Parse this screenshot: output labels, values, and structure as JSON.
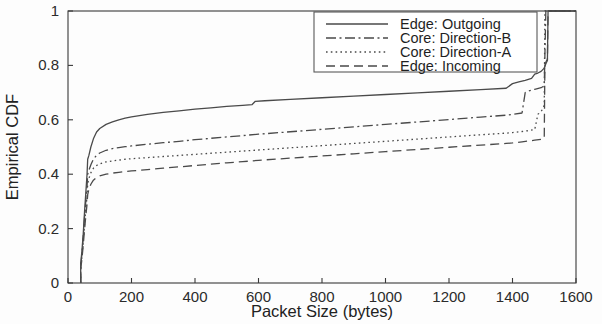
{
  "chart_data": {
    "type": "line",
    "title": "",
    "xlabel": "Packet Size (bytes)",
    "ylabel": "Empirical CDF",
    "xlim": [
      0,
      1600
    ],
    "ylim": [
      0,
      1
    ],
    "xticks": [
      0,
      200,
      400,
      600,
      800,
      1000,
      1200,
      1400,
      1600
    ],
    "xtick_labels": [
      "0",
      "200",
      "400",
      "600",
      "800",
      "1000",
      "1200",
      "1400",
      "1600"
    ],
    "yticks": [
      0,
      0.2,
      0.4,
      0.6,
      0.8,
      1
    ],
    "ytick_labels": [
      "0",
      "0.2",
      "0.4",
      "0.6",
      "0.8",
      "1"
    ],
    "grid": false,
    "legend_position": "upper center",
    "line_color": "#4a4a4a",
    "series": [
      {
        "name": "Edge: Outgoing",
        "dash": "solid",
        "points": [
          [
            40,
            0.0
          ],
          [
            40,
            0.07
          ],
          [
            44,
            0.12
          ],
          [
            48,
            0.18
          ],
          [
            52,
            0.26
          ],
          [
            56,
            0.33
          ],
          [
            60,
            0.4
          ],
          [
            62,
            0.455
          ],
          [
            66,
            0.47
          ],
          [
            72,
            0.5
          ],
          [
            80,
            0.53
          ],
          [
            90,
            0.555
          ],
          [
            100,
            0.568
          ],
          [
            120,
            0.583
          ],
          [
            140,
            0.592
          ],
          [
            160,
            0.6
          ],
          [
            180,
            0.606
          ],
          [
            200,
            0.611
          ],
          [
            250,
            0.62
          ],
          [
            300,
            0.627
          ],
          [
            350,
            0.633
          ],
          [
            400,
            0.639
          ],
          [
            450,
            0.644
          ],
          [
            500,
            0.649
          ],
          [
            550,
            0.653
          ],
          [
            580,
            0.656
          ],
          [
            590,
            0.668
          ],
          [
            620,
            0.67
          ],
          [
            700,
            0.675
          ],
          [
            800,
            0.681
          ],
          [
            900,
            0.687
          ],
          [
            1000,
            0.693
          ],
          [
            1100,
            0.699
          ],
          [
            1200,
            0.705
          ],
          [
            1300,
            0.711
          ],
          [
            1380,
            0.716
          ],
          [
            1400,
            0.733
          ],
          [
            1420,
            0.739
          ],
          [
            1440,
            0.745
          ],
          [
            1460,
            0.752
          ],
          [
            1470,
            0.768
          ],
          [
            1480,
            0.772
          ],
          [
            1490,
            0.778
          ],
          [
            1500,
            0.79
          ],
          [
            1505,
            0.806
          ],
          [
            1510,
            0.818
          ],
          [
            1512,
            1.0
          ],
          [
            1600,
            1.0
          ]
        ]
      },
      {
        "name": "Core: Direction-B",
        "dash": "dashdot",
        "points": [
          [
            40,
            0.0
          ],
          [
            40,
            0.06
          ],
          [
            44,
            0.11
          ],
          [
            48,
            0.17
          ],
          [
            52,
            0.24
          ],
          [
            56,
            0.3
          ],
          [
            60,
            0.355
          ],
          [
            62,
            0.4
          ],
          [
            66,
            0.415
          ],
          [
            72,
            0.435
          ],
          [
            80,
            0.455
          ],
          [
            90,
            0.47
          ],
          [
            100,
            0.478
          ],
          [
            120,
            0.488
          ],
          [
            140,
            0.494
          ],
          [
            160,
            0.498
          ],
          [
            180,
            0.501
          ],
          [
            200,
            0.504
          ],
          [
            250,
            0.51
          ],
          [
            300,
            0.516
          ],
          [
            350,
            0.521
          ],
          [
            400,
            0.527
          ],
          [
            450,
            0.532
          ],
          [
            500,
            0.537
          ],
          [
            550,
            0.542
          ],
          [
            600,
            0.547
          ],
          [
            700,
            0.556
          ],
          [
            800,
            0.565
          ],
          [
            900,
            0.574
          ],
          [
            1000,
            0.583
          ],
          [
            1100,
            0.592
          ],
          [
            1200,
            0.601
          ],
          [
            1300,
            0.61
          ],
          [
            1380,
            0.617
          ],
          [
            1400,
            0.62
          ],
          [
            1430,
            0.625
          ],
          [
            1440,
            0.7
          ],
          [
            1450,
            0.706
          ],
          [
            1470,
            0.712
          ],
          [
            1490,
            0.718
          ],
          [
            1500,
            0.725
          ],
          [
            1505,
            1.0
          ],
          [
            1600,
            1.0
          ]
        ]
      },
      {
        "name": "Core: Direction-A",
        "dash": "dotted",
        "points": [
          [
            40,
            0.0
          ],
          [
            40,
            0.055
          ],
          [
            44,
            0.1
          ],
          [
            48,
            0.155
          ],
          [
            52,
            0.215
          ],
          [
            56,
            0.27
          ],
          [
            60,
            0.32
          ],
          [
            62,
            0.365
          ],
          [
            66,
            0.385
          ],
          [
            72,
            0.405
          ],
          [
            80,
            0.422
          ],
          [
            90,
            0.432
          ],
          [
            100,
            0.438
          ],
          [
            120,
            0.445
          ],
          [
            140,
            0.449
          ],
          [
            160,
            0.452
          ],
          [
            180,
            0.455
          ],
          [
            200,
            0.457
          ],
          [
            250,
            0.461
          ],
          [
            300,
            0.465
          ],
          [
            350,
            0.469
          ],
          [
            400,
            0.473
          ],
          [
            450,
            0.477
          ],
          [
            500,
            0.481
          ],
          [
            550,
            0.485
          ],
          [
            600,
            0.489
          ],
          [
            700,
            0.497
          ],
          [
            800,
            0.505
          ],
          [
            900,
            0.513
          ],
          [
            1000,
            0.521
          ],
          [
            1100,
            0.529
          ],
          [
            1200,
            0.537
          ],
          [
            1300,
            0.545
          ],
          [
            1380,
            0.551
          ],
          [
            1400,
            0.553
          ],
          [
            1430,
            0.557
          ],
          [
            1450,
            0.56
          ],
          [
            1470,
            0.564
          ],
          [
            1480,
            0.62
          ],
          [
            1490,
            0.63
          ],
          [
            1495,
            0.64
          ],
          [
            1500,
            0.655
          ],
          [
            1502,
            1.0
          ],
          [
            1600,
            1.0
          ]
        ]
      },
      {
        "name": "Edge: Incoming",
        "dash": "dashed",
        "points": [
          [
            40,
            0.0
          ],
          [
            40,
            0.05
          ],
          [
            44,
            0.09
          ],
          [
            48,
            0.14
          ],
          [
            52,
            0.195
          ],
          [
            56,
            0.245
          ],
          [
            60,
            0.29
          ],
          [
            62,
            0.325
          ],
          [
            66,
            0.345
          ],
          [
            72,
            0.363
          ],
          [
            80,
            0.378
          ],
          [
            90,
            0.388
          ],
          [
            100,
            0.394
          ],
          [
            120,
            0.4
          ],
          [
            140,
            0.404
          ],
          [
            160,
            0.407
          ],
          [
            180,
            0.41
          ],
          [
            200,
            0.412
          ],
          [
            250,
            0.417
          ],
          [
            300,
            0.422
          ],
          [
            350,
            0.427
          ],
          [
            400,
            0.432
          ],
          [
            450,
            0.437
          ],
          [
            500,
            0.442
          ],
          [
            550,
            0.446
          ],
          [
            600,
            0.451
          ],
          [
            700,
            0.459
          ],
          [
            800,
            0.467
          ],
          [
            900,
            0.475
          ],
          [
            1000,
            0.483
          ],
          [
            1100,
            0.491
          ],
          [
            1200,
            0.499
          ],
          [
            1300,
            0.507
          ],
          [
            1380,
            0.513
          ],
          [
            1400,
            0.515
          ],
          [
            1430,
            0.519
          ],
          [
            1450,
            0.522
          ],
          [
            1470,
            0.525
          ],
          [
            1490,
            0.528
          ],
          [
            1500,
            0.532
          ],
          [
            1502,
            0.8
          ],
          [
            1506,
            0.815
          ],
          [
            1510,
            0.822
          ],
          [
            1512,
            1.0
          ],
          [
            1600,
            1.0
          ]
        ]
      }
    ]
  }
}
